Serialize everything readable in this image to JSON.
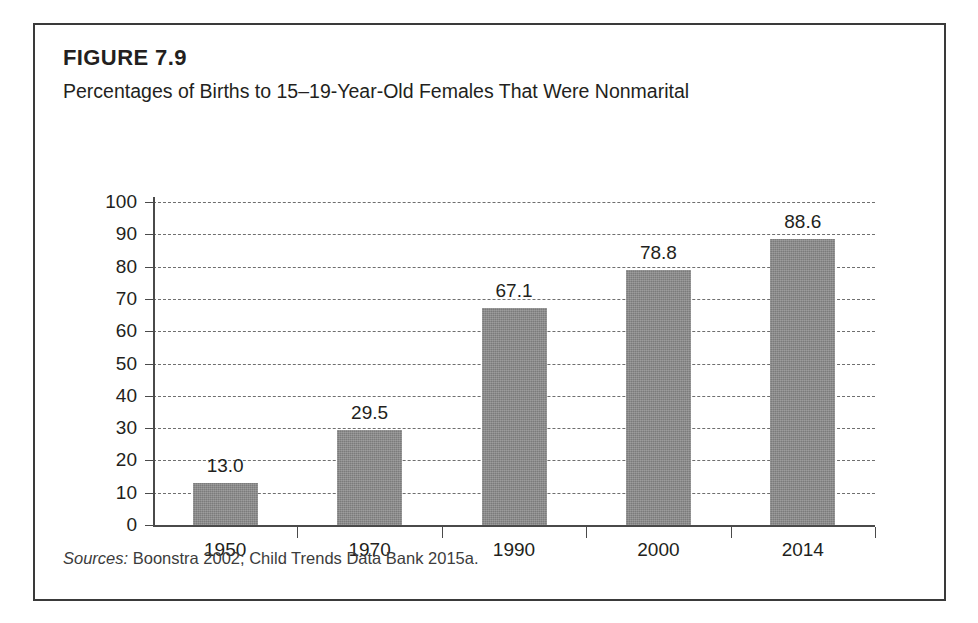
{
  "figure": {
    "number": "FIGURE 7.9",
    "title": "Percentages of Births to 15–19-Year-Old Females That Were Nonmarital",
    "sources_label": "Sources:",
    "sources_text": " Boonstra 2002; Child Trends Data Bank 2015a."
  },
  "colors": {
    "bar_fill": "#878787",
    "frame": "#3a3a3a",
    "axis": "#4a4a4a",
    "gridline": "#6f6f6f",
    "text": "#231f20",
    "background": "#ffffff"
  },
  "chart_data": {
    "type": "bar",
    "title": "Percentages of Births to 15–19-Year-Old Females That Were Nonmarital",
    "subtitle": "FIGURE 7.9",
    "categories": [
      "1950",
      "1970",
      "1990",
      "2000",
      "2014"
    ],
    "values": [
      13.0,
      29.5,
      67.1,
      78.8,
      88.6
    ],
    "data_labels": [
      "13.0",
      "29.5",
      "67.1",
      "78.8",
      "88.6"
    ],
    "xlabel": "",
    "ylabel": "",
    "ylim": [
      0,
      100
    ],
    "ytick_values": [
      0,
      10,
      20,
      30,
      40,
      50,
      60,
      70,
      80,
      90,
      100
    ],
    "ytick_labels": [
      "0",
      "10",
      "20",
      "30",
      "40",
      "50",
      "60",
      "70",
      "80",
      "90",
      "100"
    ],
    "grid": true,
    "grid_style": "dashed-horizontal",
    "legend": null,
    "legend_position": "none",
    "source_note": "Sources: Boonstra 2002; Child Trends Data Bank 2015a."
  }
}
